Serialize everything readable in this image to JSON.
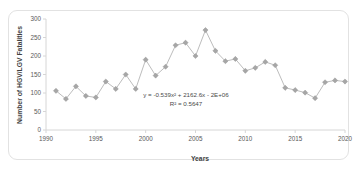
{
  "figure": {
    "clipped_title": "",
    "frame_color": "#e2e2e2",
    "background": "#ffffff"
  },
  "axis_titles": {
    "x": "Years",
    "y": "Number of HGV/LGV Fatalities"
  },
  "annotations": {
    "equation": "y = -0.539x² + 2162.6x - 2E+06",
    "r_squared": "R² = 0.5647"
  },
  "colors": {
    "marker": "#a6a6a6",
    "series_line": "#bdbdbd",
    "trendline": "#7a7a7a",
    "axis": "#d6d6d6",
    "text": "#595959"
  },
  "chart_data": {
    "type": "line",
    "title": "",
    "xlabel": "Years",
    "ylabel": "Number of HGV/LGV Fatalities",
    "xlim": [
      1990,
      2020
    ],
    "ylim": [
      0,
      300
    ],
    "xticks": [
      1990,
      1995,
      2000,
      2005,
      2010,
      2015,
      2020
    ],
    "yticks": [
      0,
      50,
      100,
      150,
      200,
      250,
      300
    ],
    "grid": false,
    "legend": "none",
    "marker": "diamond",
    "x": [
      1991,
      1992,
      1993,
      1994,
      1995,
      1996,
      1997,
      1998,
      1999,
      2000,
      2001,
      2002,
      2003,
      2004,
      2005,
      2006,
      2007,
      2008,
      2009,
      2010,
      2011,
      2012,
      2013,
      2014,
      2015,
      2016,
      2017,
      2018,
      2019,
      2020
    ],
    "values": [
      106,
      84,
      118,
      92,
      88,
      131,
      111,
      150,
      111,
      190,
      147,
      171,
      229,
      236,
      200,
      270,
      214,
      186,
      192,
      160,
      168,
      184,
      175,
      114,
      108,
      101,
      86,
      129,
      134,
      131
    ],
    "series": [
      {
        "name": "HGV/LGV fatalities",
        "values": [
          106,
          84,
          118,
          92,
          88,
          131,
          111,
          150,
          111,
          190,
          147,
          171,
          229,
          236,
          200,
          270,
          214,
          186,
          192,
          160,
          168,
          184,
          175,
          114,
          108,
          101,
          86,
          129,
          134,
          131
        ]
      }
    ],
    "trendline": {
      "type": "polynomial",
      "order": 2,
      "equation": "y = -0.539x² + 2162.6x - 2E+06",
      "r_squared": 0.5647,
      "coefficients": {
        "a": -0.539,
        "b": 2162.6,
        "c": -2000000
      }
    }
  }
}
